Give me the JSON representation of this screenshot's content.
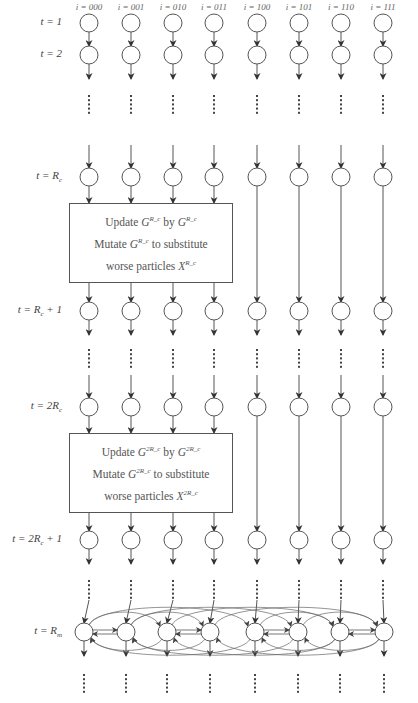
{
  "columns": {
    "labels": [
      "i = 000",
      "i = 001",
      "i = 010",
      "i = 011",
      "i = 100",
      "i = 101",
      "i = 110",
      "i = 111"
    ],
    "x": [
      89,
      131,
      173,
      214,
      257,
      299,
      341,
      383
    ]
  },
  "rows": [
    {
      "label": "t = 1",
      "y": 23
    },
    {
      "label": "t = 2",
      "y": 55
    },
    {
      "label": "t = R",
      "sub": "c",
      "y": 177
    },
    {
      "label": "t = R",
      "sub": "c",
      "suffix": " + 1",
      "y": 311
    },
    {
      "label": "t = 2R",
      "sub": "c",
      "y": 407
    },
    {
      "label": "t = 2R",
      "sub": "c",
      "suffix": " + 1",
      "y": 540
    },
    {
      "label": "t = R",
      "sub": "m",
      "y": 632
    }
  ],
  "boxes": [
    {
      "line1": {
        "prefix": "Update ",
        "g1": "G",
        "g1_sup": "R",
        "mid": " by ",
        "g2": "G",
        "g2_sup": "R"
      },
      "line2": {
        "prefix": "Mutate ",
        "g": "G",
        "g_sup": "R",
        "suffix": " to substitute"
      },
      "line3": {
        "prefix": "worse particles ",
        "x": "X",
        "x_sup": "R"
      },
      "sup_text": "R_c",
      "top": 203,
      "bottom": 283
    },
    {
      "line1": {
        "prefix": "Update ",
        "g1": "G",
        "g1_sup": "2R",
        "mid": " by ",
        "g2": "G",
        "g2_sup": "2R"
      },
      "line2": {
        "prefix": "Mutate ",
        "g": "G",
        "g_sup": "2R",
        "suffix": " to substitute"
      },
      "line3": {
        "prefix": "worse particles ",
        "x": "X",
        "x_sup": "2R"
      },
      "sup_text": "2R_c",
      "top": 433,
      "bottom": 513
    }
  ],
  "final_row": {
    "x": [
      84,
      126,
      167,
      210,
      255,
      298,
      340,
      384
    ],
    "y": 632,
    "topology": "hypercube-3d",
    "edges": [
      [
        0,
        1
      ],
      [
        2,
        3
      ],
      [
        4,
        5
      ],
      [
        6,
        7
      ],
      [
        0,
        2
      ],
      [
        1,
        3
      ],
      [
        4,
        6
      ],
      [
        5,
        7
      ],
      [
        0,
        4
      ],
      [
        1,
        5
      ],
      [
        2,
        6
      ],
      [
        3,
        7
      ]
    ]
  },
  "colors": {
    "stroke": "#555555",
    "text": "#444444",
    "background": "#ffffff"
  }
}
